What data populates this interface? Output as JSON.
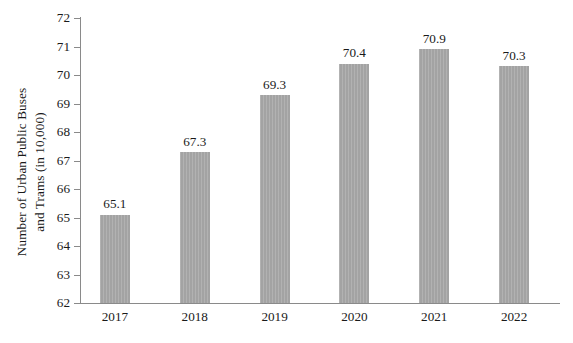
{
  "chart_data": {
    "type": "bar",
    "title": "",
    "xlabel": "",
    "ylabel": "Number of Urban Public Buses and Trams (in 10,000)",
    "ylabel_lines": [
      "Number of Urban Public Buses",
      "and Trams (in 10,000)"
    ],
    "categories": [
      "2017",
      "2018",
      "2019",
      "2020",
      "2021",
      "2022"
    ],
    "values": [
      65.1,
      67.3,
      69.3,
      70.4,
      70.9,
      70.3
    ],
    "value_labels": [
      "65.1",
      "67.3",
      "69.3",
      "70.4",
      "70.9",
      "70.3"
    ],
    "ylim": [
      62,
      72
    ],
    "yticks": [
      72,
      71,
      70,
      69,
      68,
      67,
      66,
      65,
      64,
      63,
      62
    ],
    "ytick_labels": [
      "72",
      "71",
      "70",
      "69",
      "68",
      "67",
      "66",
      "65",
      "64",
      "63",
      "62"
    ],
    "grid": false,
    "legend": null,
    "legend_position": "none",
    "bar_color": "#a3a3a3",
    "axis_color": "#8a8a8a",
    "text_color": "#1a1a1a",
    "background_color": "#ffffff"
  }
}
